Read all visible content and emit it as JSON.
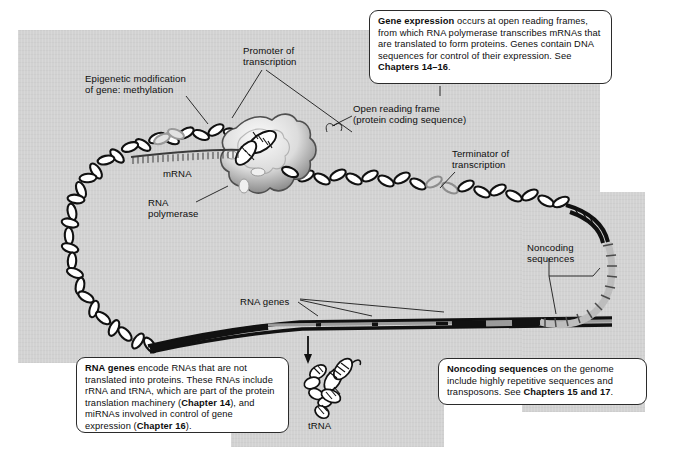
{
  "figure": {
    "panels": [
      {
        "name": "main-panel"
      },
      {
        "name": "bottom-panel"
      },
      {
        "name": "right-panel"
      }
    ]
  },
  "labels": {
    "epigenetic": "Epigenetic modification\nof gene: methylation",
    "promoter": "Promoter of\ntranscription",
    "open_reading_frame": "Open reading frame\n(protein coding sequence)",
    "terminator": "Terminator of\ntranscription",
    "mrna": "mRNA",
    "rna_polymerase": "RNA\npolymerase",
    "noncoding": "Noncoding\nsequences",
    "rna_genes": "RNA genes",
    "trna": "tRNA"
  },
  "callouts": {
    "gene_expression": {
      "lead": "Gene expression",
      "body": " occurs at open reading frames, from which RNA polymerase transcribes mRNAs that are translated to form proteins. Genes contain DNA sequences for control of their expression. See ",
      "ref": "Chapters 14–16",
      "tail": "."
    },
    "rna_genes": {
      "lead": "RNA genes",
      "body": " encode RNAs that are not translated into proteins. These RNAs include rRNA and tRNA, which are part of the protein translation machinery (",
      "ref": "Chapter 14",
      "body2": "), and miRNAs involved in control of gene expression (",
      "ref2": "Chapter 16",
      "tail": ")."
    },
    "noncoding": {
      "lead": "Noncoding sequences",
      "body": " on the genome include highly repetitive sequences and transposons. See ",
      "ref": "Chapters 15 and 17",
      "tail": "."
    }
  },
  "colors": {
    "panel_grey": "#d2d2d2",
    "ink": "#101010",
    "dna_dark": "#111111",
    "dna_mid": "#8a8a8a",
    "dna_light": "#c8c8c8",
    "callout_bg": "#ffffff",
    "page_bg": "#ffffff"
  }
}
